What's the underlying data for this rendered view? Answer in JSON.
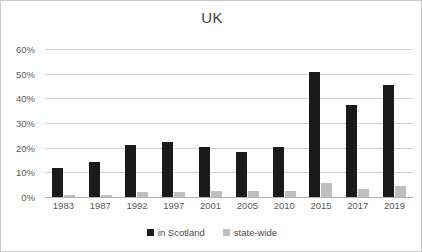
{
  "chart_data": {
    "type": "bar",
    "title": "UK",
    "xlabel": "",
    "ylabel": "",
    "categories": [
      "1983",
      "1987",
      "1992",
      "1997",
      "2001",
      "2005",
      "2010",
      "2015",
      "2017",
      "2019"
    ],
    "series": [
      {
        "name": "in Scotland",
        "color": "#1a1a1a",
        "values": [
          11.9,
          14.0,
          21.1,
          22.2,
          20.3,
          18.2,
          20.4,
          50.8,
          37.3,
          45.5
        ]
      },
      {
        "name": "state-wide",
        "color": "#bfbfbf",
        "values": [
          0.8,
          0.9,
          1.9,
          1.9,
          2.3,
          2.3,
          2.4,
          5.5,
          3.4,
          4.5
        ]
      }
    ],
    "ylim": [
      0,
      60
    ],
    "y_ticks": [
      0,
      10,
      20,
      30,
      40,
      50,
      60
    ],
    "y_tick_labels": [
      "0%",
      "10%",
      "20%",
      "30%",
      "40%",
      "50%",
      "60%"
    ],
    "grid": true,
    "legend_position": "bottom"
  },
  "legend": {
    "entries": [
      {
        "label": "in Scotland",
        "color": "#1a1a1a"
      },
      {
        "label": "state-wide",
        "color": "#bfbfbf"
      }
    ]
  },
  "frame": {
    "border_color": "#c9c9c9",
    "background": "#ffffff"
  }
}
